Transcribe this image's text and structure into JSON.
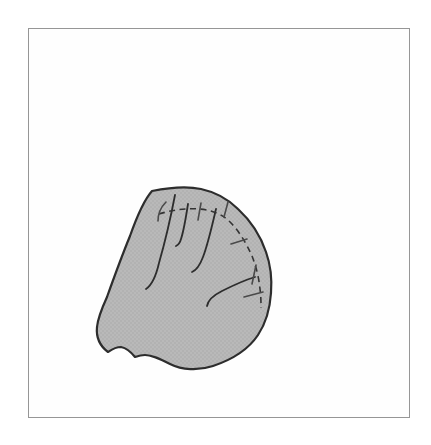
{
  "figure": {
    "colors": {
      "page_bg": "#ffffff",
      "frame_bg": "#fefefe",
      "frame_border": "#969696",
      "shape_fill": "#b9b9b9",
      "stipple_dot": "#a6a6a6",
      "shape_outline": "#2d2d2d",
      "inner_line": "#2d2d2d",
      "dashed_line": "#333333",
      "tick_color": "#4a4a4a"
    },
    "paths": {
      "outline": "M 152,191 C 167,188 187,186 201,189 C 215,192 228,199 238,209 C 251,221 261,237 266,252 C 271,266 272,280 271,293 C 270,308 266,323 258,335 C 248,350 231,360 213,366 C 198,371 182,370 170,364 C 160,359 152,355 145,355 C 141,355 138,356 135,357 C 131,352 126,348 121,347 C 115,347 111,350 108,352 C 100,346 96,337 97,327 C 98,317 102,308 107,297 C 112,283 121,258 130,236 C 136,219 144,200 152,191 Z",
      "inner_curves": [
        "M 175,195 C 171,216 165,242 159,263 C 156,276 152,285 146,289",
        "M 188,204 C 186,217 184,230 181,239 C 180,243 178,245 176,246",
        "M 216,209 C 212,226 208,244 203,257 C 200,265 197,270 192,272",
        "M 207,306 C 208,300 214,295 222,291 C 234,285 245,280 255,277"
      ],
      "dashed_margin": "M 159,214 C 172,210 186,208 199,209 C 213,210 224,215 232,224 C 241,234 247,245 252,256 C 256,266 259,278 260,289 C 261,296 261,303 261,308",
      "ticks": [
        "M 166,202 C 161,207 158,213 158,221",
        "M 201,203 L 198,220",
        "M 228,202 L 224,217",
        "M 231,244 L 247,239",
        "M 256,265 L 252,284",
        "M 244,297 L 263,292"
      ]
    }
  }
}
